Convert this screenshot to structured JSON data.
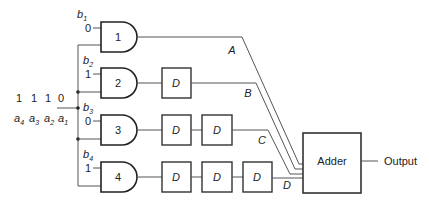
{
  "diagram": {
    "type": "logic-circuit",
    "input_word": {
      "bits": [
        "1",
        "1",
        "1",
        "0"
      ],
      "bit_labels": [
        {
          "base": "a",
          "sub": "4"
        },
        {
          "base": "a",
          "sub": "3"
        },
        {
          "base": "a",
          "sub": "2"
        },
        {
          "base": "a",
          "sub": "1"
        }
      ]
    },
    "gates": [
      {
        "id": "1",
        "coef_label": {
          "base": "b",
          "sub": "1"
        },
        "coef_value": "0",
        "delays": 0,
        "output_label": "A"
      },
      {
        "id": "2",
        "coef_label": {
          "base": "b",
          "sub": "2"
        },
        "coef_value": "1",
        "delays": 1,
        "output_label": "B"
      },
      {
        "id": "3",
        "coef_label": {
          "base": "b",
          "sub": "3"
        },
        "coef_value": "0",
        "delays": 2,
        "output_label": "C"
      },
      {
        "id": "4",
        "coef_label": {
          "base": "b",
          "sub": "4"
        },
        "coef_value": "1",
        "delays": 3,
        "output_label": "D"
      }
    ],
    "delay_label": "D",
    "adder_label": "Adder",
    "output_label": "Output"
  }
}
